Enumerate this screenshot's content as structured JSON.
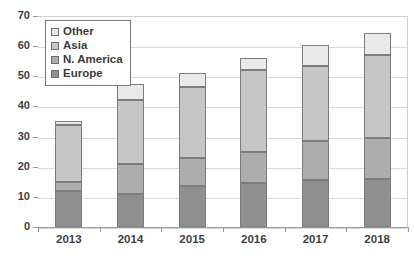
{
  "chart_data": {
    "type": "bar",
    "stacked": true,
    "title": "",
    "xlabel": "",
    "ylabel": "",
    "categories": [
      "2013",
      "2014",
      "2015",
      "2016",
      "2017",
      "2018"
    ],
    "ylim": [
      0,
      70
    ],
    "yticks": [
      0,
      10,
      20,
      30,
      40,
      50,
      60,
      70
    ],
    "grid": true,
    "legend_position": "top-left",
    "series": [
      {
        "name": "Europe",
        "color": "#8f8f8f",
        "values": [
          12.0,
          11.0,
          13.5,
          14.5,
          15.5,
          16.0
        ]
      },
      {
        "name": "N. America",
        "color": "#adadad",
        "values": [
          3.0,
          10.0,
          9.5,
          10.5,
          13.0,
          13.5
        ]
      },
      {
        "name": "Asia",
        "color": "#c6c6c6",
        "values": [
          19.0,
          21.0,
          23.5,
          27.0,
          25.0,
          27.5
        ]
      },
      {
        "name": "Other",
        "color": "#e9e9e9",
        "values": [
          1.2,
          5.5,
          4.5,
          4.0,
          7.0,
          7.5
        ]
      }
    ],
    "cumulative_tops": {
      "Europe": [
        12.0,
        11.0,
        13.5,
        14.5,
        15.5,
        16.0
      ],
      "N. America": [
        15.0,
        21.0,
        23.0,
        25.0,
        28.5,
        29.5
      ],
      "Asia": [
        34.0,
        42.0,
        46.5,
        52.0,
        53.5,
        57.0
      ],
      "Other": [
        35.2,
        47.5,
        51.0,
        56.0,
        60.5,
        64.5
      ]
    },
    "totals": [
      35.2,
      47.5,
      51.0,
      56.0,
      60.5,
      64.5
    ]
  },
  "legend": {
    "items": [
      {
        "label": "Other",
        "color": "#e9e9e9"
      },
      {
        "label": "Asia",
        "color": "#c6c6c6"
      },
      {
        "label": "N. America",
        "color": "#adadad"
      },
      {
        "label": "Europe",
        "color": "#8f8f8f"
      }
    ]
  },
  "axes": {
    "y_tick_labels": [
      "0",
      "10",
      "20",
      "30",
      "40",
      "50",
      "60",
      "70"
    ],
    "x_tick_labels": [
      "2013",
      "2014",
      "2015",
      "2016",
      "2017",
      "2018"
    ]
  }
}
